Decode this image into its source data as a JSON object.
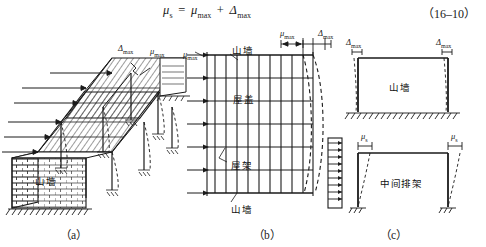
{
  "figure": {
    "equation": {
      "lhs": "μ",
      "lhs_sub": "s",
      "eq_sign": "=",
      "term1": "μ",
      "term1_sub": "max",
      "plus": "+",
      "term2": "Δ",
      "term2_sub": "max",
      "number": "（16–10）"
    },
    "panels": [
      {
        "id": "a",
        "caption": "（a）",
        "description": "isometric-building-view",
        "labels": [
          {
            "name": "delta-max-label",
            "text": "Δ",
            "sub": "max"
          },
          {
            "name": "mu-max-label",
            "text": "μ",
            "sub": "max"
          },
          {
            "name": "gable-wall-label",
            "text": "山墙"
          }
        ]
      },
      {
        "id": "b",
        "caption": "（b）",
        "description": "roof-plan-grid-with-deflection-curve",
        "labels": [
          {
            "name": "mu-max-left-label",
            "text": "μ",
            "sub": "max"
          },
          {
            "name": "mu-max-top-label",
            "text": "μ",
            "sub": "max"
          },
          {
            "name": "delta-max-top-label",
            "text": "Δ",
            "sub": "max"
          },
          {
            "name": "gable-wall-top-label",
            "text": "山墙"
          },
          {
            "name": "roof-cover-label",
            "text": "屋盖"
          },
          {
            "name": "roof-truss-label",
            "text": "屋架"
          },
          {
            "name": "gable-wall-bottom-label",
            "text": "山墙"
          }
        ]
      },
      {
        "id": "c",
        "caption": "（c）",
        "description": "gable-wall-frame-and-intermediate-bent",
        "labels": [
          {
            "name": "delta-max-left-label",
            "text": "Δ",
            "sub": "max"
          },
          {
            "name": "delta-max-right-label",
            "text": "Δ",
            "sub": "max"
          },
          {
            "name": "gable-wall-frame-label",
            "text": "山墙"
          },
          {
            "name": "mu-s-left-label",
            "text": "μ",
            "sub": "s"
          },
          {
            "name": "mu-s-right-label",
            "text": "μ",
            "sub": "s"
          },
          {
            "name": "intermediate-bent-label",
            "text": "中间排架"
          }
        ]
      }
    ],
    "colors": {
      "ink": "#1a1a1a",
      "paper": "#ffffff",
      "hatch": "#2b2b2b"
    }
  }
}
